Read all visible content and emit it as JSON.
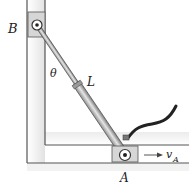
{
  "diagram": {
    "labels": {
      "slider_b": "B",
      "slider_a": "A",
      "angle": "θ",
      "length": "L",
      "velocity_main": "v",
      "velocity_sub": "A"
    },
    "colors": {
      "wall_line": "#555555",
      "wall_shadow": "#cfcfcf",
      "slider_fill": "#d6d6d6",
      "rod_fill": "#b9b9b9",
      "rod_edge": "#444444",
      "hose": "#222222",
      "text": "#222222"
    }
  }
}
